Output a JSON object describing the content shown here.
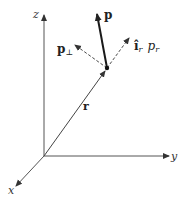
{
  "diagram": {
    "type": "3d-vector-decomposition",
    "colors": {
      "ink": "#222222",
      "axis": "#444444",
      "background": "#ffffff"
    },
    "axes": {
      "z": {
        "label": "z"
      },
      "y": {
        "label": "y"
      },
      "x": {
        "label": "x"
      }
    },
    "vectors": {
      "position": {
        "label": "r",
        "style": "solid-thin"
      },
      "momentum": {
        "label": "p",
        "style": "solid-bold"
      },
      "perpendicular": {
        "label_main": "p",
        "label_sub": "⊥",
        "style": "dashed"
      },
      "radial": {
        "unit": "î",
        "unit_sub": "r",
        "component": "p",
        "component_sub": "r",
        "style": "dashed"
      }
    }
  }
}
